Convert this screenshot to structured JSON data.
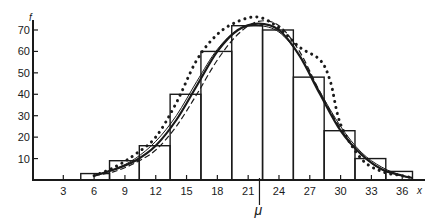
{
  "chart_data": {
    "type": "bar",
    "subtype": "histogram with fitted frequency curves",
    "title": "",
    "xlabel": "x",
    "ylabel": "f",
    "mean_marker": "μ",
    "mean_value": 22.1,
    "x_ticks": [
      3,
      6,
      9,
      12,
      15,
      18,
      21,
      24,
      27,
      30,
      33,
      36
    ],
    "y_ticks": [
      10,
      20,
      30,
      40,
      50,
      60,
      70
    ],
    "xlim": [
      0,
      38
    ],
    "ylim": [
      0,
      76
    ],
    "grid": false,
    "legend": null,
    "bins": [
      {
        "center": 6,
        "left": 4.7,
        "right": 7.5,
        "frequency": 3
      },
      {
        "center": 9,
        "left": 7.5,
        "right": 10.4,
        "frequency": 9
      },
      {
        "center": 12,
        "left": 10.4,
        "right": 13.4,
        "frequency": 16
      },
      {
        "center": 15,
        "left": 13.4,
        "right": 16.4,
        "frequency": 40
      },
      {
        "center": 18,
        "left": 16.4,
        "right": 19.4,
        "frequency": 60
      },
      {
        "center": 21,
        "left": 19.4,
        "right": 22.4,
        "frequency": 72
      },
      {
        "center": 24,
        "left": 22.4,
        "right": 25.4,
        "frequency": 70
      },
      {
        "center": 27,
        "left": 25.4,
        "right": 28.4,
        "frequency": 48
      },
      {
        "center": 30,
        "left": 28.4,
        "right": 31.4,
        "frequency": 23
      },
      {
        "center": 33,
        "left": 31.4,
        "right": 34.4,
        "frequency": 10
      },
      {
        "center": 36,
        "left": 34.4,
        "right": 37.0,
        "frequency": 4
      }
    ],
    "categories": [
      "6",
      "9",
      "12",
      "15",
      "18",
      "21",
      "24",
      "27",
      "30",
      "33",
      "36"
    ],
    "values": [
      3,
      9,
      16,
      40,
      60,
      72,
      70,
      48,
      23,
      10,
      4
    ],
    "series": [
      {
        "name": "thick solid curve",
        "style": "solid-thick",
        "x": [
          6,
          8,
          10,
          12,
          14,
          16,
          18,
          20,
          22,
          24,
          26,
          28,
          30,
          32,
          34,
          36,
          37
        ],
        "y": [
          2,
          5,
          9,
          16,
          28,
          44,
          60,
          70,
          73,
          70,
          58,
          40,
          23,
          12,
          5,
          2,
          1
        ]
      },
      {
        "name": "thin solid curve",
        "style": "solid-thin",
        "x": [
          6,
          8,
          10,
          12,
          14,
          16,
          18,
          20,
          22,
          24,
          26,
          28,
          30,
          32,
          34,
          36,
          37
        ],
        "y": [
          2,
          5,
          10,
          18,
          30,
          46,
          61,
          70,
          72,
          69,
          58,
          41,
          25,
          13,
          6,
          2,
          1
        ]
      },
      {
        "name": "dashed curve",
        "style": "dashed",
        "x": [
          6,
          8,
          10,
          12,
          14,
          16,
          18,
          20,
          22,
          24,
          26,
          28,
          30,
          32,
          34,
          36,
          37
        ],
        "y": [
          2,
          4,
          8,
          14,
          25,
          40,
          56,
          68,
          74,
          72,
          60,
          41,
          24,
          12,
          5,
          2,
          1
        ]
      },
      {
        "name": "dotted curve",
        "style": "dotted",
        "x": [
          6,
          8,
          10,
          12,
          14,
          16,
          18,
          20,
          22,
          24,
          26,
          28,
          29,
          30,
          32,
          34,
          36,
          37
        ],
        "y": [
          2,
          6,
          12,
          20,
          36,
          56,
          68,
          74,
          76,
          71,
          62,
          56,
          46,
          26,
          10,
          4,
          2,
          1
        ]
      }
    ]
  }
}
